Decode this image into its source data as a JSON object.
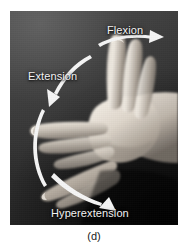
{
  "figure": {
    "caption": "(d)",
    "photo": {
      "subject": "human hand demonstrating finger joint range of motion",
      "style": "black-and-white anatomical photograph",
      "background_color": "#2b2b2b",
      "skin_highlight_color": "#e8e2da",
      "skin_midtone_color": "#b9b0a6",
      "skin_shadow_color": "#6f675f"
    },
    "annotation_color": "#f2f2f2",
    "labels": [
      {
        "id": "flexion",
        "text": "Flexion",
        "arrow": "straight-right-arrow",
        "describes": "fingers bent upward toward the palm"
      },
      {
        "id": "extension",
        "text": "Extension",
        "arrow": "curved-down-left-arrow",
        "describes": "fingers straightened to the neutral horizontal position"
      },
      {
        "id": "hyperextension",
        "text": "Hyperextension",
        "arrow": "curved-down-right-arrow",
        "describes": "fingers bent downward past the neutral position"
      }
    ],
    "hand_positions": [
      {
        "id": "flexed",
        "label_ref": "flexion",
        "orientation": "fingers pointing up"
      },
      {
        "id": "extended",
        "label_ref": "extension",
        "orientation": "fingers pointing horizontally left"
      },
      {
        "id": "hyperextended",
        "label_ref": "hyperextension",
        "orientation": "fingers angled down-left"
      }
    ]
  }
}
